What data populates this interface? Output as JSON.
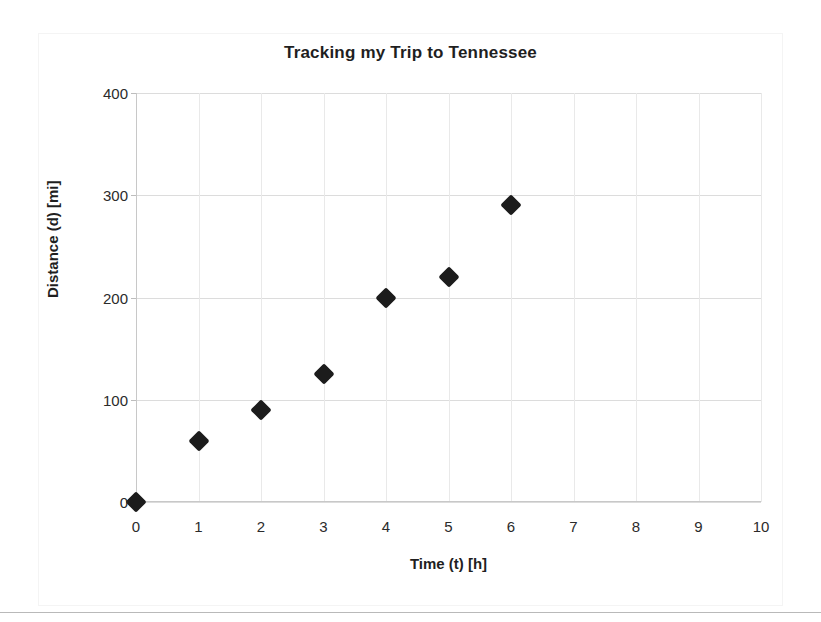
{
  "chart_data": {
    "type": "scatter",
    "title": "Tracking my Trip to Tennessee",
    "xlabel": "Time (t) [h]",
    "ylabel": "Distance (d) [mi]",
    "xlim": [
      0,
      10
    ],
    "ylim": [
      0,
      400
    ],
    "xticks": [
      "0",
      "1",
      "2",
      "3",
      "4",
      "5",
      "6",
      "7",
      "8",
      "9",
      "10"
    ],
    "yticks": [
      "0",
      "100",
      "200",
      "300",
      "400"
    ],
    "grid": true,
    "legend": "none",
    "marker": {
      "shape": "diamond",
      "color": "#1c1c1c",
      "size": 15
    },
    "series": [
      {
        "name": "Distance travelled",
        "x": [
          0,
          1,
          2,
          3,
          4,
          5,
          6
        ],
        "y": [
          0,
          60,
          90,
          125,
          200,
          220,
          290
        ],
        "points": [
          {
            "x": 0,
            "y": 0
          },
          {
            "x": 1,
            "y": 60
          },
          {
            "x": 2,
            "y": 90
          },
          {
            "x": 3,
            "y": 125
          },
          {
            "x": 4,
            "y": 200
          },
          {
            "x": 5,
            "y": 220
          },
          {
            "x": 6,
            "y": 290
          }
        ]
      }
    ]
  },
  "colors": {
    "marker": "#1c1c1c",
    "gridline": "#dcdcdc",
    "axis": "#c8c8c8",
    "background": "#ffffff"
  }
}
